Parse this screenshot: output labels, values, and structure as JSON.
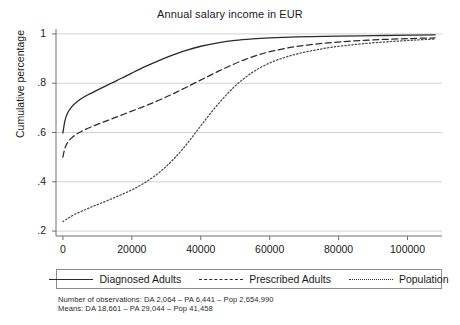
{
  "chart_data": {
    "type": "line",
    "title": "Annual salary income in EUR",
    "xlabel": "",
    "ylabel": "Cumulative percentage",
    "xlim": [
      -2000,
      110000
    ],
    "ylim": [
      0.18,
      1.02
    ],
    "xticks": [
      0,
      20000,
      40000,
      60000,
      80000,
      100000
    ],
    "xticklabels": [
      "0",
      "20000",
      "40000",
      "60000",
      "80000",
      "100000"
    ],
    "yticks": [
      0.2,
      0.4,
      0.6,
      0.8,
      1
    ],
    "yticklabels": [
      ".2",
      ".4",
      ".6",
      ".8",
      "1"
    ],
    "grid": "horizontal",
    "legend_position": "below-axes",
    "series": [
      {
        "name": "Diagnosed Adults",
        "style": "solid",
        "color": "#2b2b2b",
        "points": [
          [
            0,
            0.598
          ],
          [
            600,
            0.648
          ],
          [
            1400,
            0.68
          ],
          [
            2600,
            0.705
          ],
          [
            4200,
            0.726
          ],
          [
            6200,
            0.745
          ],
          [
            8600,
            0.762
          ],
          [
            11000,
            0.779
          ],
          [
            14000,
            0.8
          ],
          [
            17000,
            0.82
          ],
          [
            20000,
            0.841
          ],
          [
            24000,
            0.868
          ],
          [
            28000,
            0.893
          ],
          [
            32000,
            0.915
          ],
          [
            36000,
            0.934
          ],
          [
            40000,
            0.95
          ],
          [
            45000,
            0.964
          ],
          [
            50000,
            0.974
          ],
          [
            55000,
            0.98
          ],
          [
            60000,
            0.984
          ],
          [
            66000,
            0.987
          ],
          [
            72000,
            0.989
          ],
          [
            80000,
            0.991
          ],
          [
            90000,
            0.993
          ],
          [
            100000,
            0.995
          ],
          [
            108000,
            0.996
          ]
        ]
      },
      {
        "name": "Prescribed Adults",
        "style": "dashed",
        "color": "#2b2b2b",
        "points": [
          [
            0,
            0.5
          ],
          [
            500,
            0.532
          ],
          [
            1200,
            0.556
          ],
          [
            2400,
            0.576
          ],
          [
            4000,
            0.594
          ],
          [
            6200,
            0.61
          ],
          [
            8800,
            0.626
          ],
          [
            11500,
            0.641
          ],
          [
            14500,
            0.657
          ],
          [
            18000,
            0.676
          ],
          [
            21500,
            0.695
          ],
          [
            25000,
            0.714
          ],
          [
            29000,
            0.738
          ],
          [
            33000,
            0.764
          ],
          [
            37000,
            0.792
          ],
          [
            41000,
            0.82
          ],
          [
            45000,
            0.848
          ],
          [
            49000,
            0.874
          ],
          [
            53000,
            0.897
          ],
          [
            57000,
            0.916
          ],
          [
            61000,
            0.931
          ],
          [
            66000,
            0.945
          ],
          [
            71000,
            0.955
          ],
          [
            77000,
            0.964
          ],
          [
            84000,
            0.971
          ],
          [
            92000,
            0.977
          ],
          [
            100000,
            0.981
          ],
          [
            108000,
            0.984
          ]
        ]
      },
      {
        "name": "Population",
        "style": "dotted",
        "color": "#4a4a4a",
        "points": [
          [
            0,
            0.238
          ],
          [
            1500,
            0.252
          ],
          [
            3500,
            0.268
          ],
          [
            6000,
            0.284
          ],
          [
            8500,
            0.299
          ],
          [
            11000,
            0.313
          ],
          [
            14000,
            0.33
          ],
          [
            17000,
            0.348
          ],
          [
            20000,
            0.367
          ],
          [
            23000,
            0.39
          ],
          [
            26000,
            0.417
          ],
          [
            29000,
            0.45
          ],
          [
            32000,
            0.49
          ],
          [
            35000,
            0.537
          ],
          [
            38000,
            0.59
          ],
          [
            41000,
            0.645
          ],
          [
            44000,
            0.698
          ],
          [
            47000,
            0.746
          ],
          [
            50000,
            0.789
          ],
          [
            53000,
            0.824
          ],
          [
            56000,
            0.853
          ],
          [
            60000,
            0.882
          ],
          [
            64000,
            0.903
          ],
          [
            68000,
            0.919
          ],
          [
            73000,
            0.934
          ],
          [
            78000,
            0.946
          ],
          [
            84000,
            0.956
          ],
          [
            90000,
            0.964
          ],
          [
            96000,
            0.97
          ],
          [
            102000,
            0.975
          ],
          [
            108000,
            0.979
          ]
        ]
      }
    ],
    "notes": [
      "Number of observations: DA 2,064 – PA 6,441 – Pop 2,654,990",
      "Means: DA 18,661 – PA 29,044 – Pop 41,458"
    ]
  },
  "legend": {
    "items": [
      {
        "label": "Diagnosed Adults",
        "style": "solid"
      },
      {
        "label": "Prescribed Adults",
        "style": "dashed"
      },
      {
        "label": "Population",
        "style": "dotted"
      }
    ]
  }
}
